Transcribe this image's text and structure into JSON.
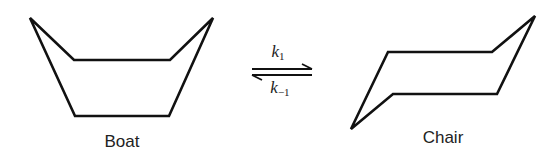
{
  "diagram": {
    "stroke_color": "#111111",
    "boat": {
      "label": "Boat",
      "points": [
        [
          30,
          18
        ],
        [
          74,
          60
        ],
        [
          170,
          60
        ],
        [
          213,
          18
        ],
        [
          169,
          116
        ],
        [
          75,
          116
        ]
      ]
    },
    "chair": {
      "label": "Chair",
      "points": [
        [
          388,
          52
        ],
        [
          492,
          52
        ],
        [
          535,
          16
        ],
        [
          497,
          94
        ],
        [
          393,
          94
        ],
        [
          351,
          129
        ]
      ]
    },
    "equilibrium": {
      "forward_rate": {
        "symbol": "k",
        "subscript": "1"
      },
      "reverse_rate": {
        "symbol": "k",
        "subscript": "−1"
      }
    }
  }
}
